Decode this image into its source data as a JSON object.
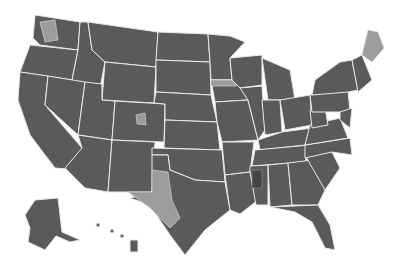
{
  "map": {
    "subject": "United States congressional districts",
    "style": "grayscale choropleth",
    "colors": {
      "background": "#ffffff",
      "base_fill": "#5a5a5a",
      "highlight_fill": "#9c9c9c",
      "dark_fill": "#444444",
      "state_border": "#e8e8e8"
    },
    "highlighted_regions": [
      "Maine",
      "West Texas",
      "Northwest Washington",
      "Northern Iowa",
      "Central Colorado"
    ],
    "insets": [
      "Alaska",
      "Hawaii"
    ]
  }
}
